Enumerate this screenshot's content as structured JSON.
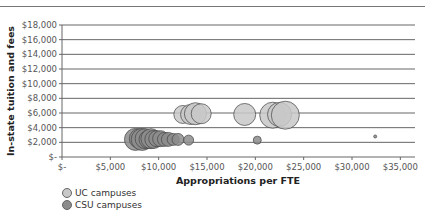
{
  "chart_data": {
    "type": "scatter",
    "subtype": "bubble",
    "title": "",
    "xlabel": "Appropriations per FTE",
    "ylabel": "In-state tuition and fees",
    "xlim": [
      0,
      36000
    ],
    "ylim": [
      0,
      18000
    ],
    "x_ticks": [
      "$-",
      "$5,000",
      "$10,000",
      "$15,000",
      "$20,000",
      "$25,000",
      "$30,000",
      "$35,000"
    ],
    "y_ticks": [
      "$-",
      "$2,000",
      "$4,000",
      "$6,000",
      "$8,000",
      "$10,000",
      "$12,000",
      "$14,000",
      "$16,000",
      "$18,000"
    ],
    "grid": true,
    "legend_position": "bottom-left",
    "series": [
      {
        "name": "UC campuses",
        "color": "#c8c8c8",
        "points": [
          {
            "x": 12500,
            "y": 5800,
            "r": 9
          },
          {
            "x": 13300,
            "y": 5800,
            "r": 10
          },
          {
            "x": 13800,
            "y": 5900,
            "r": 11
          },
          {
            "x": 14400,
            "y": 5900,
            "r": 10
          },
          {
            "x": 18900,
            "y": 5800,
            "r": 11
          },
          {
            "x": 21800,
            "y": 5700,
            "r": 13
          },
          {
            "x": 22500,
            "y": 5800,
            "r": 12
          },
          {
            "x": 23100,
            "y": 5700,
            "r": 14
          }
        ]
      },
      {
        "name": "CSU campuses",
        "color": "#8c8c8c",
        "points": [
          {
            "x": 7600,
            "y": 2400,
            "r": 11
          },
          {
            "x": 8000,
            "y": 2500,
            "r": 10
          },
          {
            "x": 8300,
            "y": 2400,
            "r": 11
          },
          {
            "x": 8600,
            "y": 2500,
            "r": 10
          },
          {
            "x": 8900,
            "y": 2400,
            "r": 9
          },
          {
            "x": 9200,
            "y": 2500,
            "r": 10
          },
          {
            "x": 9500,
            "y": 2400,
            "r": 9
          },
          {
            "x": 9800,
            "y": 2500,
            "r": 8
          },
          {
            "x": 10200,
            "y": 2500,
            "r": 8
          },
          {
            "x": 10600,
            "y": 2400,
            "r": 7
          },
          {
            "x": 11000,
            "y": 2400,
            "r": 7
          },
          {
            "x": 11500,
            "y": 2400,
            "r": 6
          },
          {
            "x": 12000,
            "y": 2400,
            "r": 6
          },
          {
            "x": 13100,
            "y": 2300,
            "r": 5
          },
          {
            "x": 20200,
            "y": 2300,
            "r": 4
          },
          {
            "x": 32400,
            "y": 2800,
            "r": 1.5
          }
        ]
      }
    ]
  },
  "legend": {
    "items": [
      {
        "label": "UC campuses",
        "color": "#c8c8c8"
      },
      {
        "label": "CSU campuses",
        "color": "#8c8c8c"
      }
    ]
  }
}
